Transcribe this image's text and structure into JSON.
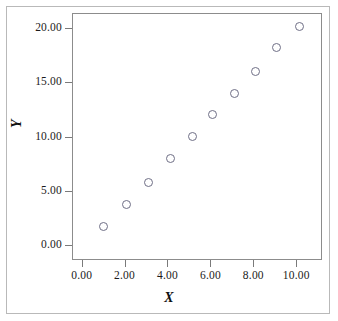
{
  "chart_data": {
    "type": "scatter",
    "title": "",
    "xlabel": "X",
    "ylabel": "Y",
    "xlim": [
      -0.45,
      11.2
    ],
    "ylim": [
      -1.4,
      21.4
    ],
    "grid": false,
    "legend": null,
    "marker": "open-circle",
    "marker_color": "#6f6f86",
    "x": [
      1.0,
      2.1,
      3.1,
      4.15,
      5.15,
      6.1,
      7.1,
      8.1,
      9.1,
      10.15
    ],
    "y": [
      1.65,
      3.7,
      5.8,
      8.0,
      10.0,
      12.0,
      14.0,
      16.0,
      18.2,
      20.2
    ],
    "points": [
      {
        "x": 1.0,
        "y": 1.65
      },
      {
        "x": 2.1,
        "y": 3.7
      },
      {
        "x": 3.1,
        "y": 5.8
      },
      {
        "x": 4.15,
        "y": 8.0
      },
      {
        "x": 5.15,
        "y": 10.0
      },
      {
        "x": 6.1,
        "y": 12.0
      },
      {
        "x": 7.1,
        "y": 14.0
      },
      {
        "x": 8.1,
        "y": 16.0
      },
      {
        "x": 9.1,
        "y": 18.2
      },
      {
        "x": 10.15,
        "y": 20.2
      }
    ],
    "xticks": [
      0,
      2,
      4,
      6,
      8,
      10
    ],
    "xticklabels": [
      "0.00",
      "2.00",
      "4.00",
      "6.00",
      "8.00",
      "10.00"
    ],
    "yticks": [
      0,
      5,
      10,
      15,
      20
    ],
    "yticklabels": [
      "0.00",
      "5.00",
      "10.00",
      "15.00",
      "20.00"
    ],
    "axis_color": "#8c8c8c",
    "frame_color": "#b9b9b9",
    "background": "#ffffff"
  }
}
